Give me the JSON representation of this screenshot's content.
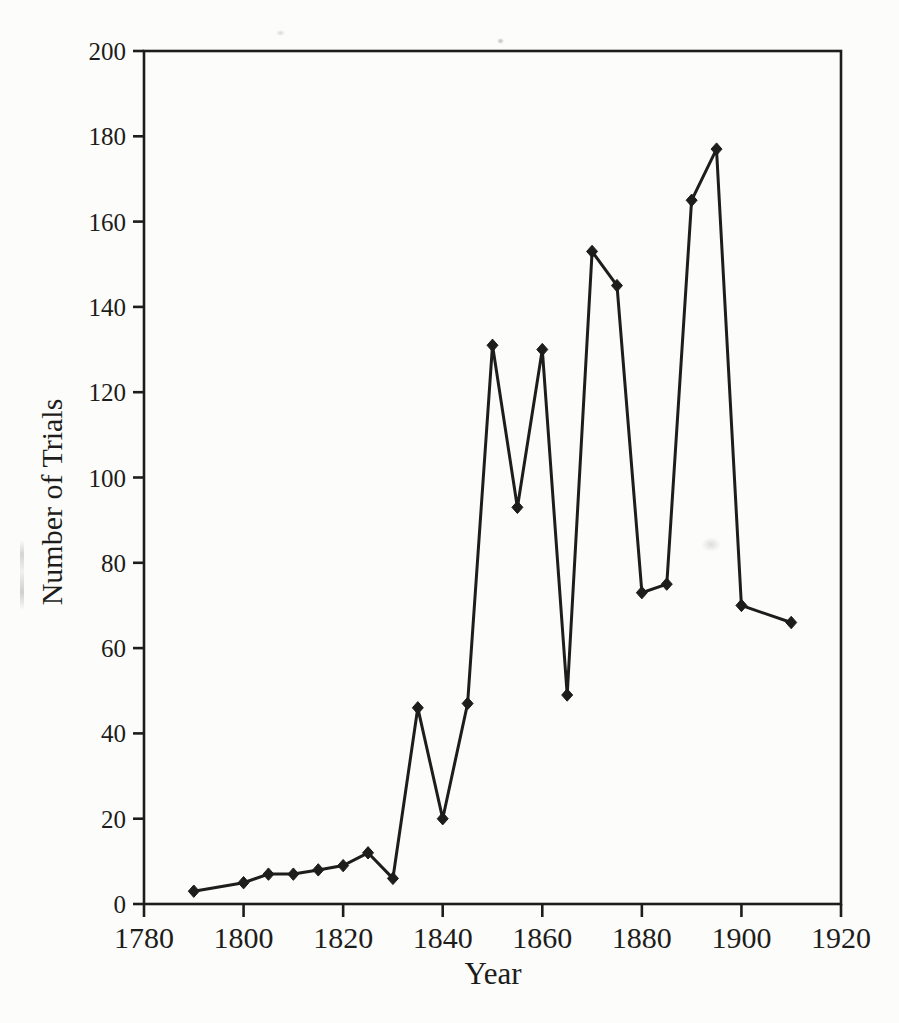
{
  "figure": {
    "xlabel": "Year",
    "ylabel": "Number of Trials"
  },
  "colors": {
    "ink": "#1d1d1b",
    "paper": "#fcfcfa"
  },
  "chart_data": {
    "type": "line",
    "title": "",
    "xlabel": "Year",
    "ylabel": "Number of Trials",
    "x": [
      1790,
      1800,
      1805,
      1810,
      1815,
      1820,
      1825,
      1830,
      1835,
      1840,
      1845,
      1850,
      1855,
      1860,
      1865,
      1870,
      1875,
      1880,
      1885,
      1890,
      1895,
      1900,
      1910
    ],
    "y": [
      3,
      5,
      7,
      7,
      8,
      9,
      12,
      6,
      46,
      20,
      47,
      131,
      93,
      130,
      49,
      153,
      145,
      73,
      75,
      165,
      177,
      70,
      66
    ],
    "xlim": [
      1780,
      1920
    ],
    "ylim": [
      0,
      200
    ],
    "x_ticks": [
      1780,
      1800,
      1820,
      1840,
      1860,
      1880,
      1900,
      1920
    ],
    "y_ticks": [
      0,
      20,
      40,
      60,
      80,
      100,
      120,
      140,
      160,
      180,
      200
    ],
    "marker": "diamond",
    "line_color": "#1d1d1b",
    "grid": false,
    "legend_position": "none",
    "frame": "box"
  }
}
